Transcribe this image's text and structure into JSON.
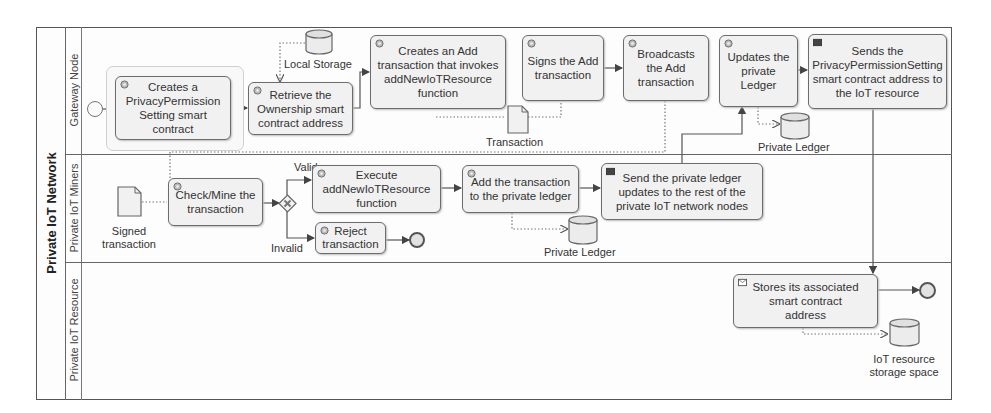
{
  "pool": {
    "title": "Private IoT Network"
  },
  "lanes": [
    {
      "label": "Gateway Node"
    },
    {
      "label": "Private IoT Miners"
    },
    {
      "label": "Private IoT Resource"
    }
  ],
  "tasks": {
    "create_contract": "Creates a PrivacyPermission Setting smart contract",
    "retrieve_address": "Retrieve the Ownership smart contract address",
    "create_add_tx": "Creates an Add transaction that invokes addNewIoTResource function",
    "sign_tx": "Signs the Add transaction",
    "broadcast_tx": "Broadcasts the Add transaction",
    "update_ledger": "Updates the private Ledger",
    "send_address": "Sends the PrivacyPermissionSetting smart contract address to the IoT resource",
    "check_mine": "Check/Mine the transaction",
    "execute_function": "Execute addNewIoTResource function",
    "reject_tx": "Reject transaction",
    "add_to_ledger": "Add the transaction to the private ledger",
    "send_updates": "Send the private ledger updates to the rest of the private IoT network nodes",
    "store_address": "Stores its associated smart contract address"
  },
  "data_stores": {
    "local_storage": "Local Storage",
    "private_ledger_gateway": "Private Ledger",
    "private_ledger_miners": "Private Ledger",
    "iot_storage": "IoT resource storage space"
  },
  "data_objects": {
    "transaction": "Transaction",
    "signed_transaction": "Signed transaction"
  },
  "gateway": {
    "type": "exclusive",
    "valid_label": "Valid",
    "invalid_label": "Invalid"
  },
  "colors": {
    "line": "#555555",
    "task_fill": "#f1f1f1",
    "task_border": "#6c6c6c"
  }
}
